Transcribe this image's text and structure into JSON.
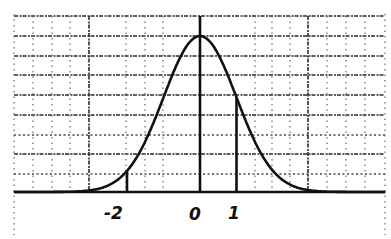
{
  "chart_data": {
    "type": "line",
    "title": "",
    "subtitle": "",
    "xlabel": "",
    "ylabel": "",
    "series": [
      {
        "name": "normal density",
        "function": "exp(-x^2/2)",
        "x": [
          -5,
          -4.5,
          -4,
          -3.5,
          -3,
          -2.5,
          -2,
          -1.5,
          -1,
          -0.5,
          0,
          0.5,
          1,
          1.5,
          2,
          2.5,
          3,
          3.5,
          4,
          4.5,
          5
        ],
        "y": [
          0.0,
          0.0,
          0.0003,
          0.0022,
          0.0111,
          0.0439,
          0.1353,
          0.3247,
          0.6065,
          0.8825,
          1.0,
          0.8825,
          0.6065,
          0.3247,
          0.1353,
          0.0439,
          0.0111,
          0.0022,
          0.0003,
          0.0,
          0.0
        ]
      }
    ],
    "x_tick_labels": [
      "-2",
      "0",
      "1"
    ],
    "x_tick_values": [
      -2,
      0,
      1
    ],
    "vertical_markers": [
      {
        "x": -2,
        "label": "-2"
      },
      {
        "x": 0,
        "label": "0"
      },
      {
        "x": 1,
        "label": "1"
      }
    ],
    "xlim": [
      -5.1,
      5.1
    ],
    "ylim": [
      0,
      1.13
    ],
    "grid": true,
    "legend": "none"
  },
  "labels": {
    "minus_two": "-2",
    "zero": "0",
    "one": "1"
  }
}
